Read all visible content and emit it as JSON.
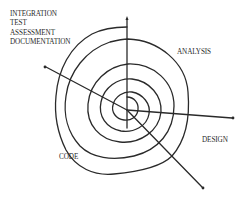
{
  "diagram": {
    "phases": {
      "top_left": [
        "INTEGRATION",
        "TEST",
        "ASSESSMENT",
        "DOCUMENTATION"
      ],
      "analysis": "ANALYSIS",
      "design": "DESIGN",
      "code": "CODE"
    },
    "colors": {
      "stroke": "#2a2a2a",
      "background": "#ffffff"
    },
    "axes": [
      {
        "name": "up",
        "to": [
          127,
          18
        ]
      },
      {
        "name": "right",
        "to": [
          233,
          118
        ]
      },
      {
        "name": "down-right",
        "to": [
          203,
          188
        ]
      },
      {
        "name": "up-left",
        "to": [
          45,
          67
        ]
      }
    ],
    "center": [
      127,
      110
    ]
  }
}
